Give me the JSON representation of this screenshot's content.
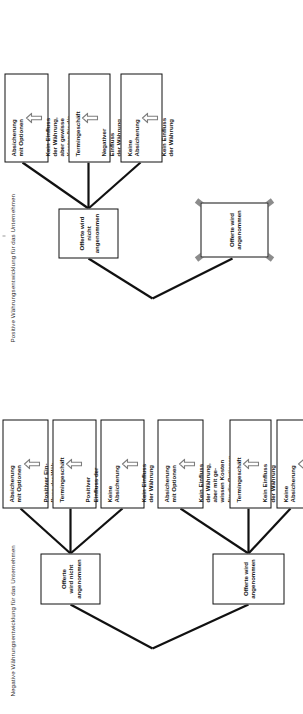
{
  "figure": {
    "title_top": "Negative Währungsentwicklung für das Unternehmen",
    "title_bottom": "Positive Währungsentwicklung für das Unternehmen",
    "arrow_icon": "up-arrow-icon",
    "line_color": "#111111",
    "cross_color": "#8c8c8c",
    "box_border_color": "#111111",
    "background": "#ffffff"
  },
  "branches": [
    {
      "id": "positive",
      "header": "Positive Währungsentwicklung für das Unternehmen",
      "decisions": [
        {
          "id": "pos-accepted",
          "label": "Offerte wird\nangenommen",
          "struck_out": true,
          "outcomes": []
        },
        {
          "id": "pos-not-accepted",
          "label": "Offerte wird nicht\nangenommen",
          "struck_out": false,
          "outcomes": [
            {
              "id": "pos-na-keine",
              "title": "Keine\nAbsicherung",
              "desc": "Kein Einfluss\nder Währung"
            },
            {
              "id": "pos-na-termin",
              "title": "Termingeschäft",
              "desc": "Negativer\nEinfluss\nder Währung"
            },
            {
              "id": "pos-na-optionen",
              "title": "Absicherung\nmit Optionen",
              "desc": "Kein Einfluss\nder Währung,\naber gewisse\nKosten für die\nOptionen"
            }
          ]
        }
      ]
    },
    {
      "id": "negative",
      "header": "Negative Währungsentwicklung für das Unternehmen",
      "decisions": [
        {
          "id": "neg-accepted",
          "label": "Offerte wird\nangenommen",
          "struck_out": false,
          "outcomes": [
            {
              "id": "neg-a-keine",
              "title": "Keine\nAbsicherung",
              "desc": "Negativer Ein-\nfluss der Wäh-\nrung wegen des\nKursverlustes"
            },
            {
              "id": "neg-a-termin",
              "title": "Termingeschäft",
              "desc": "Kein Einfluss\nder Währung"
            },
            {
              "id": "neg-a-optionen",
              "title": "Absicherung\nmit Optionen",
              "desc": "Kein Einfluss\nder Währung,\naber mit ge-\nwissen Kosten\nfür die Optionen"
            }
          ]
        },
        {
          "id": "neg-not-accepted",
          "label": "Offerte\nwird nicht\nangenommen",
          "struck_out": false,
          "outcomes": [
            {
              "id": "neg-na-keine",
              "title": "Keine\nAbsicherung",
              "desc": "Kein Einfluss\nder Währung"
            },
            {
              "id": "neg-na-termin",
              "title": "Termingeschäft",
              "desc": "Positiver\nEinfluss der\nWährung"
            },
            {
              "id": "neg-na-optionen",
              "title": "Absicherung\nmit Optionen",
              "desc": "Positiver Ein-\nfluss der Wäh-\nrung, aber mit\ngewissen Kosten\nfür die Optionen"
            }
          ]
        }
      ]
    }
  ]
}
